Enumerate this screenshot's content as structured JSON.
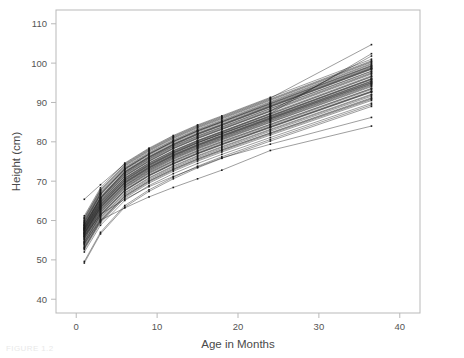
{
  "chart_data": {
    "type": "line",
    "title": "",
    "subtitle": "",
    "xlabel": "Age in Months",
    "ylabel": "Height (cm)",
    "xlim": [
      -2.5,
      42.5
    ],
    "ylim": [
      36.5,
      113.5
    ],
    "xticks": [
      0,
      10,
      20,
      30,
      40
    ],
    "xticklabels": [
      "0",
      "10",
      "20",
      "30",
      "40"
    ],
    "yticks": [
      40,
      50,
      60,
      70,
      80,
      90,
      100,
      110
    ],
    "yticklabels": [
      "40",
      "50",
      "60",
      "70",
      "80",
      "90",
      "100",
      "110"
    ],
    "grid": false,
    "legend": null,
    "marker": "square",
    "marker_size": 1.6,
    "line_color": "#1a1a1a",
    "line_width": 0.5,
    "frame_color": "#b9b9b9",
    "x": [
      1,
      3,
      6,
      9,
      12,
      15,
      18,
      24,
      36.5
    ],
    "series": [
      {
        "name": "s1",
        "values": [
          57.5,
          64.2,
          70.6,
          74.3,
          77.4,
          80.1,
          82.4,
          87.0,
          96.5
        ]
      },
      {
        "name": "s2",
        "values": [
          56.1,
          62.8,
          69.0,
          72.9,
          76.0,
          78.6,
          80.9,
          85.4,
          94.6
        ]
      },
      {
        "name": "s3",
        "values": [
          58.4,
          65.6,
          72.1,
          75.9,
          79.1,
          81.8,
          84.1,
          88.8,
          98.4
        ]
      },
      {
        "name": "s4",
        "values": [
          54.3,
          61.1,
          67.5,
          71.3,
          74.3,
          76.9,
          79.2,
          83.6,
          92.6
        ]
      },
      {
        "name": "s5",
        "values": [
          59.2,
          66.4,
          72.8,
          76.6,
          79.8,
          82.5,
          84.8,
          89.4,
          99.0
        ]
      },
      {
        "name": "s6",
        "values": [
          55.6,
          62.3,
          68.6,
          72.4,
          75.5,
          78.1,
          80.4,
          84.9,
          94.0
        ]
      },
      {
        "name": "s7",
        "values": [
          57.0,
          63.8,
          70.1,
          73.9,
          77.0,
          79.7,
          82.0,
          86.5,
          95.9
        ]
      },
      {
        "name": "s8",
        "values": [
          53.2,
          60.0,
          66.3,
          70.1,
          73.1,
          75.7,
          78.0,
          82.3,
          91.2
        ]
      },
      {
        "name": "s9",
        "values": [
          58.0,
          65.0,
          71.4,
          75.2,
          78.4,
          81.0,
          83.3,
          87.9,
          97.4
        ]
      },
      {
        "name": "s10",
        "values": [
          56.8,
          63.5,
          69.8,
          73.6,
          76.7,
          79.3,
          81.6,
          86.1,
          95.4
        ]
      },
      {
        "name": "s11",
        "values": [
          60.1,
          67.2,
          73.5,
          77.3,
          80.5,
          83.2,
          85.5,
          90.2,
          99.9
        ]
      },
      {
        "name": "s12",
        "values": [
          52.6,
          59.4,
          65.7,
          69.5,
          72.5,
          75.1,
          77.4,
          81.7,
          90.5
        ]
      },
      {
        "name": "s13",
        "values": [
          57.8,
          64.6,
          70.9,
          74.7,
          77.8,
          80.4,
          82.7,
          87.3,
          96.8
        ]
      },
      {
        "name": "s14",
        "values": [
          55.1,
          61.8,
          68.1,
          71.9,
          74.9,
          77.5,
          79.8,
          84.2,
          93.3
        ]
      },
      {
        "name": "s15",
        "values": [
          59.7,
          66.8,
          73.1,
          76.9,
          80.1,
          82.8,
          85.1,
          89.8,
          99.4
        ]
      },
      {
        "name": "s16",
        "values": [
          56.4,
          63.1,
          69.4,
          73.2,
          76.3,
          78.9,
          81.2,
          85.7,
          94.9
        ]
      },
      {
        "name": "s17",
        "values": [
          58.7,
          65.8,
          72.3,
          76.1,
          79.3,
          82.0,
          84.3,
          89.0,
          98.6
        ]
      },
      {
        "name": "s18",
        "values": [
          54.8,
          61.5,
          67.8,
          71.6,
          74.6,
          77.2,
          79.5,
          83.9,
          92.9
        ]
      },
      {
        "name": "s19",
        "values": [
          57.3,
          64.0,
          70.3,
          74.1,
          77.2,
          79.8,
          82.1,
          86.6,
          96.0
        ]
      },
      {
        "name": "s20",
        "values": [
          53.8,
          60.6,
          66.9,
          70.7,
          73.7,
          76.3,
          78.6,
          83.0,
          91.9
        ]
      },
      {
        "name": "s21",
        "values": [
          59.0,
          66.0,
          72.5,
          76.3,
          79.5,
          82.2,
          84.5,
          89.2,
          98.8
        ]
      },
      {
        "name": "s22",
        "values": [
          56.6,
          63.3,
          69.6,
          73.4,
          76.5,
          79.1,
          81.4,
          85.9,
          95.1
        ]
      },
      {
        "name": "s23",
        "values": [
          58.2,
          65.2,
          71.6,
          75.4,
          78.6,
          81.2,
          83.5,
          88.1,
          97.6
        ]
      },
      {
        "name": "s24",
        "values": [
          55.4,
          62.0,
          68.3,
          72.1,
          75.1,
          77.7,
          80.0,
          84.4,
          93.5
        ]
      },
      {
        "name": "s25",
        "values": [
          60.4,
          67.5,
          73.8,
          77.6,
          80.8,
          83.5,
          85.8,
          90.5,
          100.2
        ]
      },
      {
        "name": "s26",
        "values": [
          52.0,
          58.8,
          65.1,
          68.9,
          71.9,
          74.5,
          76.8,
          81.1,
          89.8
        ]
      },
      {
        "name": "s27",
        "values": [
          57.6,
          64.4,
          70.7,
          74.5,
          77.6,
          80.2,
          82.5,
          87.1,
          96.6
        ]
      },
      {
        "name": "s28",
        "values": [
          54.5,
          61.3,
          67.6,
          71.4,
          74.4,
          77.0,
          79.3,
          83.7,
          92.7
        ]
      },
      {
        "name": "s29",
        "values": [
          59.4,
          66.6,
          73.0,
          76.8,
          80.0,
          82.7,
          85.0,
          89.6,
          99.2
        ]
      },
      {
        "name": "s30",
        "values": [
          56.2,
          62.9,
          69.2,
          73.0,
          76.1,
          78.7,
          81.0,
          85.5,
          94.7
        ]
      },
      {
        "name": "s31",
        "values": [
          58.9,
          65.9,
          72.4,
          76.2,
          79.4,
          82.1,
          84.4,
          89.1,
          98.7
        ]
      },
      {
        "name": "s32",
        "values": [
          53.5,
          60.3,
          66.6,
          70.4,
          73.4,
          76.0,
          78.3,
          82.7,
          91.6
        ]
      },
      {
        "name": "s33",
        "values": [
          57.1,
          63.9,
          70.2,
          74.0,
          77.1,
          79.7,
          82.0,
          86.4,
          95.8
        ]
      },
      {
        "name": "s34",
        "values": [
          55.9,
          62.6,
          68.9,
          72.7,
          75.8,
          78.4,
          80.7,
          85.2,
          94.4
        ]
      },
      {
        "name": "s35",
        "values": [
          60.8,
          67.9,
          74.2,
          78.0,
          81.2,
          83.9,
          86.2,
          90.9,
          100.6
        ]
      },
      {
        "name": "s36",
        "values": [
          54.0,
          60.8,
          67.1,
          70.9,
          73.9,
          76.5,
          78.8,
          83.2,
          92.1
        ]
      },
      {
        "name": "s37",
        "values": [
          58.6,
          65.5,
          71.9,
          75.7,
          78.9,
          81.5,
          83.8,
          88.5,
          98.0
        ]
      },
      {
        "name": "s38",
        "values": [
          56.9,
          63.6,
          69.9,
          73.7,
          76.8,
          79.4,
          81.7,
          86.2,
          95.5
        ]
      },
      {
        "name": "s39",
        "values": [
          59.9,
          67.0,
          73.3,
          77.1,
          80.3,
          83.0,
          85.3,
          90.0,
          99.7
        ]
      },
      {
        "name": "s40",
        "values": [
          52.9,
          59.7,
          66.0,
          69.8,
          72.8,
          75.4,
          77.7,
          82.0,
          90.8
        ]
      },
      {
        "name": "s41",
        "values": [
          57.4,
          64.1,
          70.4,
          74.2,
          77.3,
          79.9,
          82.2,
          86.7,
          96.1
        ]
      },
      {
        "name": "s42",
        "values": [
          55.8,
          62.5,
          68.8,
          72.6,
          75.7,
          78.3,
          80.6,
          85.0,
          94.2
        ]
      },
      {
        "name": "s43",
        "values": [
          58.3,
          65.4,
          71.8,
          75.6,
          78.8,
          81.4,
          83.7,
          88.4,
          97.9
        ]
      },
      {
        "name": "s44",
        "values": [
          54.6,
          61.4,
          67.7,
          71.5,
          74.5,
          77.1,
          79.4,
          83.8,
          92.8
        ]
      },
      {
        "name": "s45",
        "values": [
          60.6,
          67.7,
          74.0,
          77.8,
          81.0,
          83.7,
          86.0,
          90.7,
          100.4
        ]
      },
      {
        "name": "s46",
        "values": [
          56.5,
          63.2,
          69.5,
          73.3,
          76.4,
          79.0,
          81.3,
          85.8,
          95.0
        ]
      },
      {
        "name": "s47",
        "values": [
          59.5,
          66.7,
          73.1,
          76.9,
          80.1,
          82.8,
          85.1,
          89.7,
          99.3
        ]
      },
      {
        "name": "s48",
        "values": [
          53.0,
          59.9,
          66.2,
          70.0,
          73.0,
          75.6,
          77.9,
          82.2,
          91.0
        ]
      },
      {
        "name": "s49",
        "values": [
          57.9,
          64.8,
          71.2,
          75.0,
          78.2,
          80.8,
          83.1,
          87.7,
          97.2
        ]
      },
      {
        "name": "s50",
        "values": [
          55.3,
          62.1,
          68.4,
          72.2,
          75.2,
          77.8,
          80.1,
          84.5,
          93.6
        ]
      },
      {
        "name": "s51",
        "values": [
          61.2,
          68.3,
          74.6,
          78.4,
          81.6,
          84.3,
          86.6,
          91.3,
          101.0
        ]
      },
      {
        "name": "s52",
        "values": [
          49.6,
          57.0,
          63.8,
          67.8,
          71.0,
          73.8,
          76.2,
          80.6,
          89.4
        ]
      },
      {
        "name": "s53",
        "values": [
          49.2,
          56.6,
          63.4,
          67.4,
          70.6,
          73.4,
          75.8,
          80.2,
          89.0
        ]
      },
      {
        "name": "s54",
        "values": [
          65.4,
          69.1,
          74.4,
          78.2,
          81.4,
          84.1,
          86.4,
          91.1,
          104.7
        ]
      },
      {
        "name": "s55",
        "values": [
          58.1,
          64.9,
          71.3,
          75.1,
          78.3,
          80.9,
          83.2,
          87.8,
          101.8
        ]
      },
      {
        "name": "s56",
        "values": [
          57.7,
          64.5,
          70.8,
          74.6,
          77.7,
          80.3,
          82.6,
          87.2,
          102.4
        ]
      },
      {
        "name": "s57",
        "values": [
          54.2,
          60.1,
          63.2,
          66.0,
          68.4,
          70.6,
          72.8,
          77.8,
          84.0
        ]
      },
      {
        "name": "s58",
        "values": [
          56.0,
          61.6,
          65.4,
          68.6,
          71.2,
          73.6,
          75.9,
          79.4,
          86.2
        ]
      },
      {
        "name": "s59",
        "values": [
          56.7,
          63.4,
          69.7,
          73.5,
          76.6,
          79.2,
          81.5,
          86.0,
          95.3
        ]
      },
      {
        "name": "s60",
        "values": [
          58.8,
          65.7,
          72.2,
          76.0,
          79.2,
          81.9,
          84.2,
          88.9,
          98.5
        ]
      }
    ]
  },
  "caption": {
    "text": "FIGURE 1.2"
  }
}
